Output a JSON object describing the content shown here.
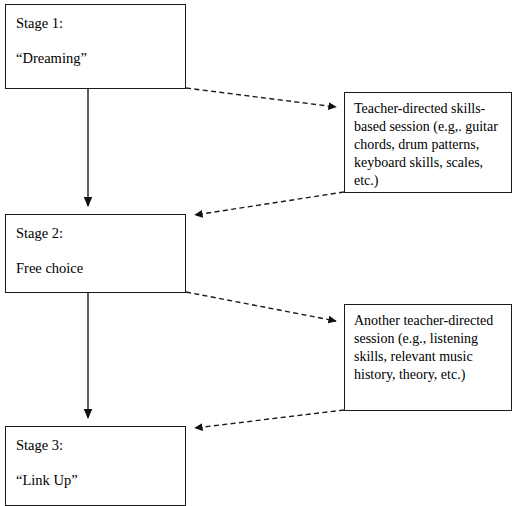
{
  "diagram": {
    "type": "flowchart",
    "background_color": "#ffffff",
    "line_color": "#1a1a1a",
    "stages": [
      {
        "id": "stage-1",
        "label": "Stage 1:",
        "name": "“Dreaming”"
      },
      {
        "id": "stage-2",
        "label": "Stage 2:",
        "name": "Free choice"
      },
      {
        "id": "stage-3",
        "label": "Stage 3:",
        "name": "“Link Up”"
      }
    ],
    "details": [
      {
        "id": "detail-1",
        "text": "Teacher-directed skills-based session (e.g,. guitar chords, drum patterns, keyboard skills, scales, etc.)"
      },
      {
        "id": "detail-2",
        "text": "Another teacher-directed session (e.g., listening skills, relevant music history, theory, etc.)"
      }
    ],
    "connectors": [
      {
        "id": "stage1-to-stage2",
        "style": "solid",
        "from": "stage-1",
        "to": "stage-2",
        "direction": "down"
      },
      {
        "id": "stage1-to-detail1",
        "style": "dashed",
        "from": "stage-1",
        "to": "detail-1",
        "direction": "right"
      },
      {
        "id": "detail1-to-stage2",
        "style": "dashed",
        "from": "detail-1",
        "to": "stage-2",
        "direction": "left"
      },
      {
        "id": "stage2-to-stage3",
        "style": "solid",
        "from": "stage-2",
        "to": "stage-3",
        "direction": "down"
      },
      {
        "id": "stage2-to-detail2",
        "style": "dashed",
        "from": "stage-2",
        "to": "detail-2",
        "direction": "right"
      },
      {
        "id": "detail2-to-stage3",
        "style": "dashed",
        "from": "detail-2",
        "to": "stage-3",
        "direction": "left"
      }
    ]
  }
}
